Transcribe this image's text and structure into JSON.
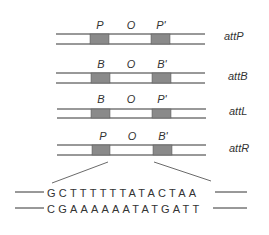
{
  "diagram": {
    "colors": {
      "line": "#333333",
      "box": "#8a8a8a"
    },
    "rows": [
      {
        "name": "attP",
        "left": "P",
        "core": "O",
        "right": "P'"
      },
      {
        "name": "attB",
        "left": "B",
        "core": "O",
        "right": "B'"
      },
      {
        "name": "attL",
        "left": "B",
        "core": "O",
        "right": "P'"
      },
      {
        "name": "attR",
        "left": "P",
        "core": "O",
        "right": "B'"
      }
    ],
    "sequence": {
      "top": "GCTTTTTTATACTAA",
      "bottom": "CGAAAAAATATGATT"
    }
  }
}
